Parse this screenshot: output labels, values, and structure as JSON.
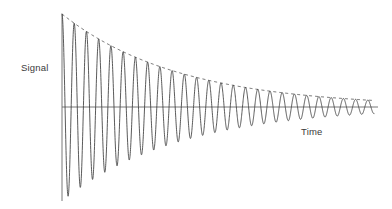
{
  "figure": {
    "title": "",
    "background_color": "#ffffff",
    "width": 392,
    "height": 209
  },
  "axes": {
    "y_axis_label": "Signal",
    "x_axis_label": "Time",
    "axis_color": "#555555",
    "axis_line_width": 0.9,
    "y_axis_x": 62,
    "y_axis_top": 14,
    "y_axis_bottom": 201,
    "x_axis_y": 107,
    "x_axis_left": 62,
    "x_axis_right": 378,
    "ticks": [],
    "tick_labels": [],
    "grid": false
  },
  "series": {
    "signal": {
      "name": "damped oscillation",
      "color": "#3c3c3c",
      "line_width": 0.85,
      "style": "solid"
    },
    "envelope": {
      "name": "decay envelope",
      "color": "#4a4a4a",
      "line_width": 0.8,
      "style": "dashed",
      "dash_pattern": "3,3",
      "side": "upper"
    }
  },
  "chart_data": {
    "type": "line",
    "title": "",
    "xlabel": "Time",
    "ylabel": "Signal",
    "grid": false,
    "legend": false,
    "xlim": [
      0,
      27.5
    ],
    "ylim": [
      -1.15,
      1.0
    ],
    "model": {
      "form": "y(t) = A * exp(-t / tau) * cos(2*pi*t / T)",
      "amplitude": 1.0,
      "tau": 9.6,
      "period": 1.0,
      "negative_lobe_scale": 1.12,
      "t_start": 0,
      "t_end": 25.5,
      "samples": 2400
    },
    "series": [
      {
        "name": "signal",
        "style": "solid",
        "color": "#3c3c3c"
      },
      {
        "name": "envelope",
        "style": "dashed",
        "color": "#4a4a4a"
      }
    ],
    "peaks": {
      "t": [
        0,
        1,
        2,
        3,
        4,
        5,
        6,
        7,
        8,
        9,
        10,
        11,
        12,
        13,
        14,
        15,
        16,
        17,
        18,
        19,
        20,
        21,
        22,
        23,
        24,
        25
      ],
      "y": [
        1.0,
        0.901,
        0.811,
        0.731,
        0.658,
        0.593,
        0.534,
        0.481,
        0.433,
        0.39,
        0.351,
        0.316,
        0.285,
        0.257,
        0.231,
        0.208,
        0.188,
        0.169,
        0.152,
        0.137,
        0.123,
        0.111,
        0.1,
        0.09,
        0.081,
        0.073
      ]
    },
    "troughs": {
      "t": [
        0.5,
        1.5,
        2.5,
        3.5,
        4.5,
        5.5,
        6.5,
        7.5,
        8.5,
        9.5,
        10.5,
        11.5,
        12.5,
        13.5,
        14.5,
        15.5,
        16.5,
        17.5,
        18.5,
        19.5,
        20.5,
        21.5,
        22.5,
        23.5,
        24.5
      ],
      "y": [
        -1.06,
        -0.955,
        -0.86,
        -0.774,
        -0.697,
        -0.628,
        -0.566,
        -0.509,
        -0.459,
        -0.413,
        -0.372,
        -0.335,
        -0.302,
        -0.272,
        -0.245,
        -0.221,
        -0.199,
        -0.179,
        -0.161,
        -0.145,
        -0.131,
        -0.118,
        -0.106,
        -0.096,
        -0.086
      ]
    }
  }
}
